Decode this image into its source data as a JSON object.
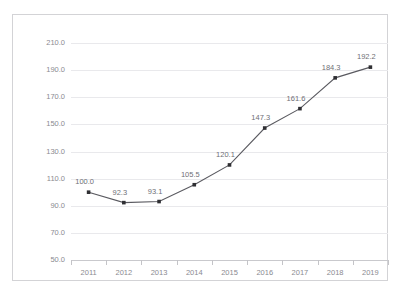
{
  "chart_data": {
    "type": "line",
    "title": "",
    "xlabel": "",
    "ylabel": "",
    "categories": [
      "2011",
      "2012",
      "2013",
      "2014",
      "2015",
      "2016",
      "2017",
      "2018",
      "2019"
    ],
    "values": [
      100.0,
      92.3,
      93.1,
      105.5,
      120.1,
      147.3,
      161.6,
      184.3,
      192.2
    ],
    "data_labels": [
      "100.0",
      "92.3",
      "93.1",
      "105.5",
      "120.1",
      "147.3",
      "161.6",
      "184.3",
      "192.2"
    ],
    "series": [
      {
        "name": "",
        "values": [
          100.0,
          92.3,
          93.1,
          105.5,
          120.1,
          147.3,
          161.6,
          184.3,
          192.2
        ]
      }
    ],
    "ylim": [
      50.0,
      210.0
    ],
    "ytick_step": 20.0,
    "ytick_labels": [
      "210.0",
      "190.0",
      "170.0",
      "150.0",
      "130.0",
      "110.0",
      "90.0",
      "70.0",
      "50.0"
    ],
    "ytick_values": [
      210.0,
      190.0,
      170.0,
      150.0,
      130.0,
      110.0,
      90.0,
      70.0,
      50.0
    ],
    "grid": true,
    "legend": false,
    "legend_position": "none",
    "marker": "square",
    "line_color": "#5a5a60",
    "marker_color": "#2f2f33",
    "grid_color": "#e9e9ec",
    "axis_color": "#c9c9cd",
    "label_color": "#8a8a90",
    "background": "#ffffff",
    "frame_color": "#d3d3d6"
  }
}
